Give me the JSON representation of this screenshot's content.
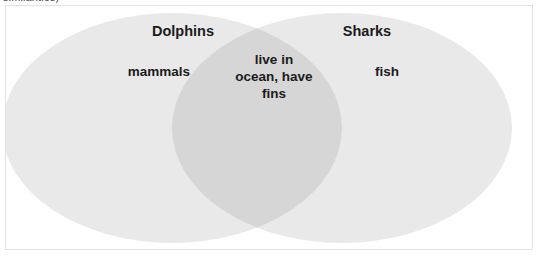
{
  "caption": {
    "clipped_text": "similarities)"
  },
  "diagram": {
    "type": "venn-2-set",
    "left_set": {
      "title": "Dolphins",
      "unique_traits": "mammals"
    },
    "right_set": {
      "title": "Sharks",
      "unique_traits": "fish"
    },
    "intersection": {
      "shared_traits": "live in\nocean, have\nfins"
    },
    "colors": {
      "circle_fill": "#e9e9e9",
      "overlap_fill": "#d6d6d6",
      "text": "#1b1b1b",
      "frame_border": "#e3e3e3",
      "background": "#ffffff"
    }
  }
}
